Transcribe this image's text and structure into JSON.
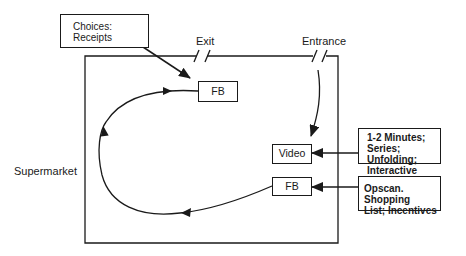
{
  "diagram": {
    "container_label": "Supermarket",
    "doors": {
      "exit": "Exit",
      "entrance": "Entrance"
    },
    "nodes": {
      "fb_top": "FB",
      "video": "Video",
      "fb_bottom": "FB"
    },
    "notes": {
      "choices": [
        "Choices:",
        "Receipts"
      ],
      "video_info": [
        "1-2 Minutes;",
        "Series; Unfolding;",
        "Interactive"
      ],
      "fb_info": [
        "Opscan. Shopping",
        "List; Incentives"
      ]
    },
    "flow": [
      "Entrance",
      "Video",
      "FB",
      "FB",
      "Exit"
    ],
    "colors": {
      "line": "#1a1a1a",
      "background": "#ffffff"
    }
  }
}
